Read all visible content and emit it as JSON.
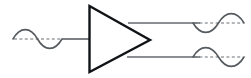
{
  "figure": {
    "title": "",
    "type": "schematic-diagram",
    "background_color": "#ffffff"
  },
  "colors": {
    "waveform_stroke": "#555a5e",
    "axis_dash": "#6b7074",
    "wire": "#666b70",
    "amplifier_outline": "#111417",
    "amplifier_fill": "#ffffff"
  },
  "components": {
    "amplifier": {
      "name": "amplifier-triangle",
      "shape": "right-pointing-triangle",
      "label": "",
      "left_x": 89,
      "top_y": 6,
      "bottom_y": 72,
      "apex_x": 150,
      "apex_y": 40
    },
    "input_wire": {
      "name": "input-wire",
      "from_x": 62,
      "to_x": 89,
      "y": 39
    },
    "output_wire_top": {
      "name": "output-wire-top",
      "from_x": 128,
      "to_x": 200,
      "y": 23
    },
    "output_wire_bottom": {
      "name": "output-wire-bottom",
      "from_x": 127,
      "to_x": 200,
      "y": 57
    }
  },
  "waveforms": [
    {
      "name": "input-waveform",
      "role": "input",
      "phase": "non-inverted",
      "first_lobe": "positive",
      "cycles": 1,
      "center_y": 39,
      "amplitude": 12,
      "start_x": 13,
      "end_x": 62,
      "has_dashed_axis": true
    },
    {
      "name": "output-waveform-top",
      "role": "output-inverted",
      "phase": "inverted",
      "first_lobe": "negative",
      "cycles": 1,
      "center_y": 23,
      "amplitude": 12,
      "start_x": 193,
      "end_x": 244,
      "has_dashed_axis": true
    },
    {
      "name": "output-waveform-bottom",
      "role": "output-in-phase",
      "phase": "non-inverted",
      "first_lobe": "positive",
      "cycles": 1,
      "center_y": 57,
      "amplitude": 12,
      "start_x": 193,
      "end_x": 244,
      "has_dashed_axis": true
    }
  ]
}
